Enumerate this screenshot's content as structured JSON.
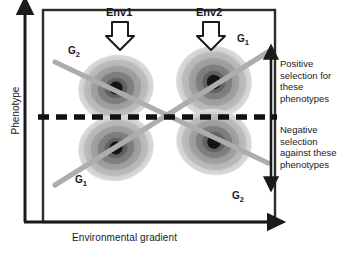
{
  "figure": {
    "type": "genotype-by-environment-interaction-diagram",
    "axes": {
      "x_label": "Environmental gradient",
      "y_label": "Phenotype"
    },
    "environments": [
      {
        "id": "env1",
        "label": "Env1",
        "icon": "down-block-arrow"
      },
      {
        "id": "env2",
        "label": "Env2",
        "icon": "down-block-arrow"
      }
    ],
    "genotype_labels": [
      {
        "id": "g2-top-left",
        "text": "G",
        "sub": "2"
      },
      {
        "id": "g1-top-right",
        "text": "G",
        "sub": "1"
      },
      {
        "id": "g1-bottom-left",
        "text": "G",
        "sub": "1"
      },
      {
        "id": "g2-bottom-right",
        "text": "G",
        "sub": "2"
      }
    ],
    "selection": {
      "positive": "Positive selection for these phenotypes",
      "positive_lines": [
        "Positive",
        "selection for",
        "these",
        "phenotypes"
      ],
      "negative": "Negative selection against these phenotypes",
      "negative_lines": [
        "Negative",
        "selection",
        "against these",
        "phenotypes"
      ],
      "divider": "dashed-threshold-line",
      "arrow": "double-headed-vertical-arrow"
    },
    "clusters": [
      {
        "id": "cluster-top-left",
        "cx": 116,
        "cy": 88,
        "rx": 38,
        "ry": 33,
        "rotate": -12
      },
      {
        "id": "cluster-top-right",
        "cx": 214,
        "cy": 82,
        "rx": 38,
        "ry": 36,
        "rotate": 10
      },
      {
        "id": "cluster-bottom-left",
        "cx": 116,
        "cy": 148,
        "rx": 38,
        "ry": 33,
        "rotate": -12
      },
      {
        "id": "cluster-bottom-right",
        "cx": 214,
        "cy": 142,
        "rx": 38,
        "ry": 33,
        "rotate": 10
      }
    ],
    "reaction_norms": [
      {
        "id": "norm-g2",
        "from": [
          55,
          62
        ],
        "to": [
          268,
          163
        ],
        "note": "G2 descending"
      },
      {
        "id": "norm-g1",
        "from": [
          55,
          185
        ],
        "to": [
          268,
          52
        ],
        "note": "G1 ascending"
      }
    ],
    "colors": {
      "axis": "#1a1a1a",
      "frame": "#262626",
      "dashed_line": "#111111",
      "norm_line": "#a8a8a8",
      "cluster_outer": "#c6c6c6",
      "cluster_mid": "#9a9a9a",
      "cluster_inner": "#6f6f6f",
      "cluster_core": "#4a4a4a",
      "cluster_dot": "#141414",
      "text": "#1a1a1a",
      "background": "#ffffff"
    }
  }
}
